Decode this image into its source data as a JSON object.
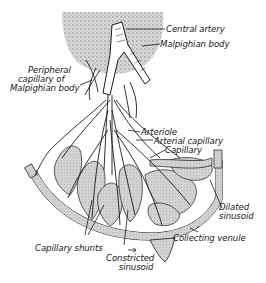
{
  "diagram": {
    "colors": {
      "ink": "#1a1a1a",
      "malpighian_stipple": "#c9c9c9",
      "sinusoid_fill": "#cfcfcf",
      "background": "#ffffff"
    },
    "labels": {
      "central_artery": "Central artery",
      "malpighian_body": "Malpighian body",
      "peripheral_capillary_l1": "Peripheral",
      "peripheral_capillary_l2": "capillary of",
      "peripheral_capillary_l3": "Malpighian body",
      "arteriole": "Arteriole",
      "arterial_capillary": "Arterial capillary",
      "capillary": "Capillary",
      "dilated_sinusoid_l1": "Dilated",
      "dilated_sinusoid_l2": "sinusoid",
      "collecting_venule": "Collecting venule",
      "capillary_shunts": "Capillary shunts",
      "constricted_sinusoid_l1": "Constricted",
      "constricted_sinusoid_l2": "sinusoid"
    }
  }
}
